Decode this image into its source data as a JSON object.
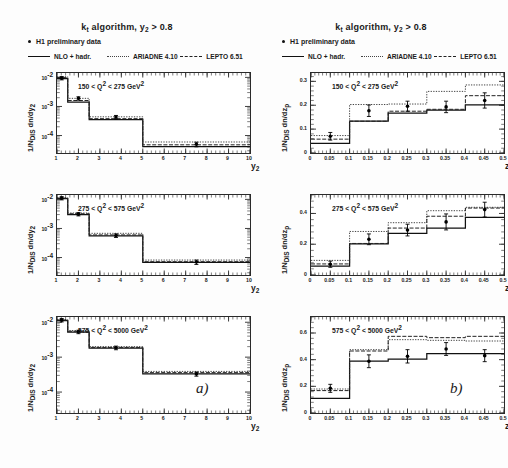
{
  "figure": {
    "title_main": "k",
    "title_sub": "t",
    "title_rest": " algorithm, y",
    "title_sub2": "2",
    "title_tail": " > 0.8",
    "part_a": "a)",
    "part_b": "b)"
  },
  "legend": {
    "data_label": "H1 preliminary data",
    "entries": [
      {
        "label": "NLO + hadr.",
        "style": "solid"
      },
      {
        "label": "ARIADNE 4.10",
        "style": "dotted"
      },
      {
        "label": "LEPTO 6.51",
        "style": "dashed"
      }
    ]
  },
  "chart_data": [
    {
      "type": "bar",
      "panel": "a1",
      "title": "150 < Q^2 < 275 GeV^2",
      "title_pre": "150 < Q",
      "title_sup": "2",
      "title_mid": " < 275 GeV",
      "title_sup2": "2",
      "xlabel": "y_2",
      "xlabel_main": "y",
      "xlabel_sub": "2",
      "ylabel": "1/N_DIS dn/dy_2",
      "ylabel_pre": "1/N",
      "ylabel_sub": "DIS",
      "ylabel_post": " dn/dy",
      "ylabel_sub2": "2",
      "xlim": [
        1,
        10
      ],
      "ylim_log": [
        -4.6,
        -1.85
      ],
      "yscale": "log",
      "xticks": [
        1,
        2,
        3,
        4,
        5,
        6,
        7,
        8,
        9,
        10
      ],
      "xtick_labels": [
        "1",
        "2",
        "3",
        "4",
        "5",
        "6",
        "7",
        "8",
        "9",
        "10"
      ],
      "yticks_exp": [
        -2,
        -3,
        -4
      ],
      "ytick_labels": [
        "10",
        "10",
        "10"
      ],
      "ytick_sups": [
        "-2",
        "-3",
        "-4"
      ],
      "bin_edges": [
        1.0,
        1.5,
        2.5,
        5.0,
        10.0
      ],
      "series": [
        {
          "name": "NLO + hadr.",
          "style": "solid",
          "values": [
            0.009,
            0.0014,
            0.00035,
            4.2e-05
          ]
        },
        {
          "name": "ARIADNE 4.10",
          "style": "dotted",
          "values": [
            0.0105,
            0.0019,
            0.00044,
            6e-05
          ]
        },
        {
          "name": "LEPTO 6.51",
          "style": "dashed",
          "values": [
            0.0098,
            0.0016,
            0.00038,
            4.8e-05
          ]
        }
      ],
      "points": [
        {
          "x": 1.22,
          "y": 0.0094,
          "yerr_lo": 0.0012,
          "yerr_hi": 0.0012
        },
        {
          "x": 2.0,
          "y": 0.0019,
          "yerr_lo": 0.00025,
          "yerr_hi": 0.00025
        },
        {
          "x": 3.75,
          "y": 0.00043,
          "yerr_lo": 6e-05,
          "yerr_hi": 6e-05
        },
        {
          "x": 7.5,
          "y": 5e-05,
          "yerr_lo": 9e-06,
          "yerr_hi": 9e-06
        }
      ]
    },
    {
      "type": "bar",
      "panel": "a2",
      "title": "275 < Q^2 < 575 GeV^2",
      "title_pre": "275 < Q",
      "title_sup": "2",
      "title_mid": " < 575 GeV",
      "title_sup2": "2",
      "xlabel": "y_2",
      "xlabel_main": "y",
      "xlabel_sub": "2",
      "ylabel": "1/N_DIS dn/dy_2",
      "ylabel_pre": "1/N",
      "ylabel_sub": "DIS",
      "ylabel_post": " dn/dy",
      "ylabel_sub2": "2",
      "xlim": [
        1,
        10
      ],
      "ylim_log": [
        -4.6,
        -1.85
      ],
      "yscale": "log",
      "xticks": [
        1,
        2,
        3,
        4,
        5,
        6,
        7,
        8,
        9,
        10
      ],
      "xtick_labels": [
        "1",
        "2",
        "3",
        "4",
        "5",
        "6",
        "7",
        "8",
        "9",
        "10"
      ],
      "yticks_exp": [
        -2,
        -3,
        -4
      ],
      "ytick_labels": [
        "10",
        "10",
        "10"
      ],
      "ytick_sups": [
        "-2",
        "-3",
        "-4"
      ],
      "bin_edges": [
        1.0,
        1.5,
        2.5,
        5.0,
        10.0
      ],
      "series": [
        {
          "name": "NLO + hadr.",
          "style": "solid",
          "values": [
            0.0105,
            0.003,
            0.00056,
            6.8e-05
          ]
        },
        {
          "name": "ARIADNE 4.10",
          "style": "dotted",
          "values": [
            0.0115,
            0.0034,
            0.00068,
            8.2e-05
          ]
        },
        {
          "name": "LEPTO 6.51",
          "style": "dashed",
          "values": [
            0.011,
            0.0032,
            0.0006,
            7.2e-05
          ]
        }
      ],
      "points": [
        {
          "x": 1.22,
          "y": 0.011,
          "yerr_lo": 0.0014,
          "yerr_hi": 0.0014
        },
        {
          "x": 2.0,
          "y": 0.0031,
          "yerr_lo": 0.0004,
          "yerr_hi": 0.0004
        },
        {
          "x": 3.75,
          "y": 0.00057,
          "yerr_lo": 8e-05,
          "yerr_hi": 8e-05
        },
        {
          "x": 7.5,
          "y": 7e-05,
          "yerr_lo": 1.2e-05,
          "yerr_hi": 1.2e-05
        }
      ]
    },
    {
      "type": "bar",
      "panel": "a3",
      "title": "575 < Q^2 < 5000 GeV^2",
      "title_pre": "575 < Q",
      "title_sup": "2",
      "title_mid": " < 5000 GeV",
      "title_sup2": "2",
      "xlabel": "y_2",
      "xlabel_main": "y",
      "xlabel_sub": "2",
      "ylabel": "1/N_DIS dn/dy_2",
      "ylabel_pre": "1/N",
      "ylabel_sub": "DIS",
      "ylabel_post": " dn/dy",
      "ylabel_sub2": "2",
      "xlim": [
        1,
        10
      ],
      "ylim_log": [
        -4.6,
        -1.85
      ],
      "yscale": "log",
      "xticks": [
        1,
        2,
        3,
        4,
        5,
        6,
        7,
        8,
        9,
        10
      ],
      "xtick_labels": [
        "1",
        "2",
        "3",
        "4",
        "5",
        "6",
        "7",
        "8",
        "9",
        "10"
      ],
      "yticks_exp": [
        -2,
        -3,
        -4
      ],
      "ytick_labels": [
        "10",
        "10",
        "10"
      ],
      "ytick_sups": [
        "-2",
        "-3",
        "-4"
      ],
      "bin_edges": [
        1.0,
        1.5,
        2.5,
        5.0,
        10.0
      ],
      "series": [
        {
          "name": "NLO + hadr.",
          "style": "solid",
          "values": [
            0.0112,
            0.0052,
            0.0018,
            0.00033
          ]
        },
        {
          "name": "ARIADNE 4.10",
          "style": "dotted",
          "values": [
            0.012,
            0.0058,
            0.002,
            0.00039
          ]
        },
        {
          "name": "LEPTO 6.51",
          "style": "dashed",
          "values": [
            0.0116,
            0.0055,
            0.0019,
            0.00036
          ]
        }
      ],
      "points": [
        {
          "x": 1.22,
          "y": 0.0115,
          "yerr_lo": 0.0013,
          "yerr_hi": 0.0013
        },
        {
          "x": 2.0,
          "y": 0.0053,
          "yerr_lo": 0.0006,
          "yerr_hi": 0.0006
        },
        {
          "x": 3.75,
          "y": 0.00185,
          "yerr_lo": 0.00022,
          "yerr_hi": 0.00022
        },
        {
          "x": 7.5,
          "y": 0.00033,
          "yerr_lo": 4.5e-05,
          "yerr_hi": 4.5e-05
        }
      ]
    },
    {
      "type": "bar",
      "panel": "b1",
      "title": "150 < Q^2 < 275 GeV^2",
      "title_pre": "150 < Q",
      "title_sup": "2",
      "title_mid": " < 275 GeV",
      "title_sup2": "2",
      "xlabel": "z_p",
      "xlabel_main": "z",
      "xlabel_sub": "p",
      "ylabel": "1/N_DIS dn/dz_p",
      "ylabel_pre": "1/N",
      "ylabel_sub": "DIS",
      "ylabel_post": " dn/dz",
      "ylabel_sub2": "p",
      "xlim": [
        0,
        0.5
      ],
      "ylim": [
        0,
        0.335
      ],
      "yscale": "linear",
      "xticks": [
        0,
        0.05,
        0.1,
        0.15,
        0.2,
        0.25,
        0.3,
        0.35,
        0.4,
        0.45,
        0.5
      ],
      "xtick_labels": [
        "0",
        "0.05",
        "0.1",
        "0.15",
        "0.2",
        "0.25",
        "0.3",
        "0.35",
        "0.4",
        "0.45",
        "0.5"
      ],
      "yticks": [
        0,
        0.1,
        0.2,
        0.3
      ],
      "ytick_labels": [
        "0",
        "0.1",
        "0.2",
        "0.3"
      ],
      "bin_edges": [
        0.0,
        0.1,
        0.2,
        0.3,
        0.4,
        0.5
      ],
      "series": [
        {
          "name": "NLO + hadr.",
          "style": "solid",
          "values": [
            0.04,
            0.133,
            0.167,
            0.18,
            0.202
          ]
        },
        {
          "name": "ARIADNE 4.10",
          "style": "dotted",
          "values": [
            0.073,
            0.203,
            0.205,
            0.258,
            0.285
          ]
        },
        {
          "name": "LEPTO 6.51",
          "style": "dashed",
          "values": [
            0.058,
            0.133,
            0.175,
            0.183,
            0.24
          ]
        }
      ],
      "points": [
        {
          "x": 0.05,
          "y": 0.07,
          "yerr_lo": 0.016,
          "yerr_hi": 0.016
        },
        {
          "x": 0.15,
          "y": 0.177,
          "yerr_lo": 0.024,
          "yerr_hi": 0.024
        },
        {
          "x": 0.25,
          "y": 0.196,
          "yerr_lo": 0.021,
          "yerr_hi": 0.021
        },
        {
          "x": 0.35,
          "y": 0.193,
          "yerr_lo": 0.024,
          "yerr_hi": 0.024
        },
        {
          "x": 0.45,
          "y": 0.22,
          "yerr_lo": 0.032,
          "yerr_hi": 0.032
        }
      ]
    },
    {
      "type": "bar",
      "panel": "b2",
      "title": "275 < Q^2 < 575 GeV^2",
      "title_pre": "275 < Q",
      "title_sup": "2",
      "title_mid": " < 575 GeV",
      "title_sup2": "2",
      "xlabel": "z_p",
      "xlabel_main": "z",
      "xlabel_sub": "p",
      "ylabel": "1/N_DIS dn/dz_p",
      "ylabel_pre": "1/N",
      "ylabel_sub": "DIS",
      "ylabel_post": " dn/dz",
      "ylabel_sub2": "p",
      "xlim": [
        0,
        0.5
      ],
      "ylim": [
        0,
        0.52
      ],
      "yscale": "linear",
      "xticks": [
        0,
        0.05,
        0.1,
        0.15,
        0.2,
        0.25,
        0.3,
        0.35,
        0.4,
        0.45,
        0.5
      ],
      "xtick_labels": [
        "0",
        "0.05",
        "0.1",
        "0.15",
        "0.2",
        "0.25",
        "0.3",
        "0.35",
        "0.4",
        "0.45",
        "0.5"
      ],
      "yticks": [
        0,
        0.2,
        0.4
      ],
      "ytick_labels": [
        "0",
        "0.2",
        "0.4"
      ],
      "bin_edges": [
        0.0,
        0.1,
        0.2,
        0.3,
        0.4,
        0.5
      ],
      "series": [
        {
          "name": "NLO + hadr.",
          "style": "solid",
          "values": [
            0.057,
            0.202,
            0.27,
            0.305,
            0.375
          ]
        },
        {
          "name": "ARIADNE 4.10",
          "style": "dotted",
          "values": [
            0.095,
            0.283,
            0.34,
            0.418,
            0.44
          ]
        },
        {
          "name": "LEPTO 6.51",
          "style": "dashed",
          "values": [
            0.072,
            0.205,
            0.305,
            0.382,
            0.435
          ]
        }
      ],
      "points": [
        {
          "x": 0.05,
          "y": 0.07,
          "yerr_lo": 0.02,
          "yerr_hi": 0.02
        },
        {
          "x": 0.15,
          "y": 0.232,
          "yerr_lo": 0.035,
          "yerr_hi": 0.035
        },
        {
          "x": 0.25,
          "y": 0.292,
          "yerr_lo": 0.038,
          "yerr_hi": 0.038
        },
        {
          "x": 0.35,
          "y": 0.345,
          "yerr_lo": 0.052,
          "yerr_hi": 0.052
        },
        {
          "x": 0.45,
          "y": 0.425,
          "yerr_lo": 0.048,
          "yerr_hi": 0.048
        }
      ]
    },
    {
      "type": "bar",
      "panel": "b3",
      "title": "575 < Q^2 < 5000 GeV^2",
      "title_pre": "575 < Q",
      "title_sup": "2",
      "title_mid": " < 5000 GeV",
      "title_sup2": "2",
      "xlabel": "z_p",
      "xlabel_main": "z",
      "xlabel_sub": "p",
      "ylabel": "1/N_DIS dn/dz_p",
      "ylabel_pre": "1/N",
      "ylabel_sub": "DIS",
      "ylabel_post": " dn/dz",
      "ylabel_sub2": "p",
      "xlim": [
        0,
        0.5
      ],
      "ylim": [
        0,
        0.72
      ],
      "yscale": "linear",
      "xticks": [
        0,
        0.05,
        0.1,
        0.15,
        0.2,
        0.25,
        0.3,
        0.35,
        0.4,
        0.45,
        0.5
      ],
      "xtick_labels": [
        "0",
        "0.05",
        "0.1",
        "0.15",
        "0.2",
        "0.25",
        "0.3",
        "0.35",
        "0.4",
        "0.45",
        "0.5"
      ],
      "yticks": [
        0,
        0.2,
        0.4,
        0.6
      ],
      "ytick_labels": [
        "0",
        "0.2",
        "0.4",
        "0.6"
      ],
      "bin_edges": [
        0.0,
        0.1,
        0.2,
        0.3,
        0.4,
        0.5
      ],
      "series": [
        {
          "name": "NLO + hadr.",
          "style": "solid",
          "values": [
            0.11,
            0.39,
            0.405,
            0.445,
            0.445
          ]
        },
        {
          "name": "ARIADNE 4.10",
          "style": "dotted",
          "values": [
            0.18,
            0.475,
            0.55,
            0.545,
            0.54
          ]
        },
        {
          "name": "LEPTO 6.51",
          "style": "dashed",
          "values": [
            0.168,
            0.465,
            0.575,
            0.565,
            0.575
          ]
        }
      ],
      "points": [
        {
          "x": 0.05,
          "y": 0.185,
          "yerr_lo": 0.03,
          "yerr_hi": 0.03
        },
        {
          "x": 0.15,
          "y": 0.388,
          "yerr_lo": 0.048,
          "yerr_hi": 0.048
        },
        {
          "x": 0.25,
          "y": 0.425,
          "yerr_lo": 0.05,
          "yerr_hi": 0.05
        },
        {
          "x": 0.35,
          "y": 0.48,
          "yerr_lo": 0.048,
          "yerr_hi": 0.048
        },
        {
          "x": 0.45,
          "y": 0.43,
          "yerr_lo": 0.045,
          "yerr_hi": 0.045
        }
      ]
    }
  ],
  "colors": {
    "axis": "#2a2a2a",
    "solid": "#111111",
    "dotted": "#444444",
    "dashed": "#222222",
    "marker": "#000000"
  }
}
